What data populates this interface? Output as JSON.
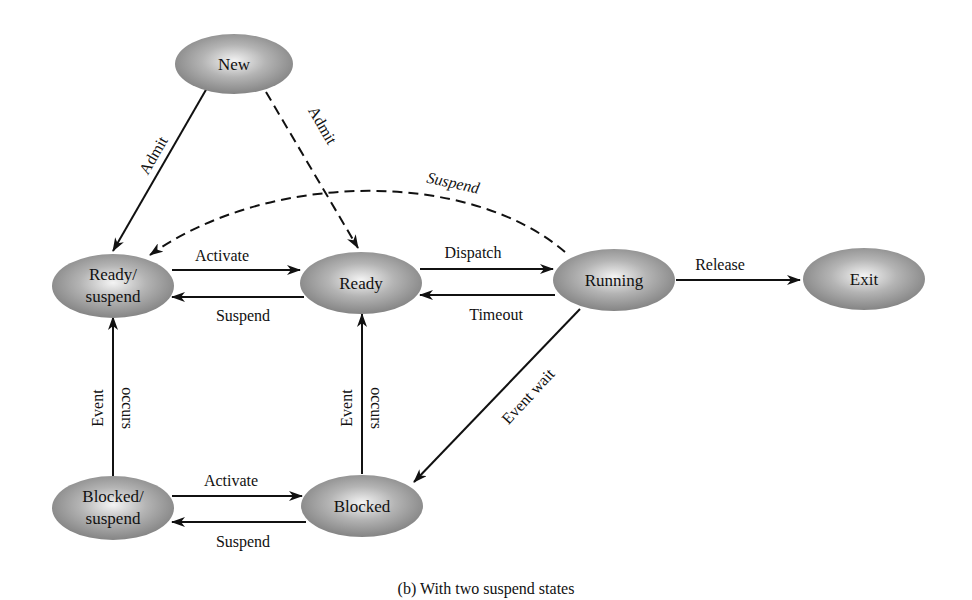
{
  "diagram": {
    "caption": "(b) With two suspend states",
    "node_color": "#8a8a8a",
    "nodes": {
      "new": "New",
      "ready_suspend_1": "Ready/",
      "ready_suspend_2": "suspend",
      "ready": "Ready",
      "running": "Running",
      "exit": "Exit",
      "blocked_suspend_1": "Blocked/",
      "blocked_suspend_2": "suspend",
      "blocked": "Blocked"
    },
    "edges": {
      "admit_solid": "Admit",
      "admit_dashed": "Admit",
      "suspend_running": "Suspend",
      "activate_ready": "Activate",
      "suspend_ready": "Suspend",
      "dispatch": "Dispatch",
      "timeout": "Timeout",
      "release": "Release",
      "event_wait": "Event wait",
      "event_occurs_left_1": "Event",
      "event_occurs_left_2": "occurs",
      "event_occurs_right_1": "Event",
      "event_occurs_right_2": "occurs",
      "activate_blocked": "Activate",
      "suspend_blocked": "Suspend"
    }
  }
}
